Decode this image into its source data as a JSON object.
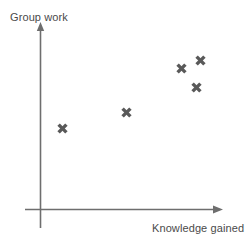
{
  "chart_data": {
    "type": "scatter",
    "title": "",
    "xlabel": "Knowledge gained",
    "ylabel": "Group work",
    "grid": false,
    "legend": null,
    "axis_arrows": true,
    "xticks": [],
    "yticks": [],
    "xlim": [
      0,
      10
    ],
    "ylim": [
      0,
      10
    ],
    "marker_style": "bold-x",
    "marker_color": "#595959",
    "axis_color": "#6e6e6e",
    "label_color": "#4a4a4a",
    "background_color": "#ffffff",
    "points": [
      {
        "x": 1.3,
        "y": 4.4
      },
      {
        "x": 4.7,
        "y": 5.3
      },
      {
        "x": 7.7,
        "y": 7.7
      },
      {
        "x": 8.8,
        "y": 8.2
      },
      {
        "x": 8.5,
        "y": 6.7
      }
    ],
    "point_pixels": [
      {
        "cx": 62,
        "cy": 128
      },
      {
        "cx": 126,
        "cy": 112
      },
      {
        "cx": 181,
        "cy": 68
      },
      {
        "cx": 200,
        "cy": 60
      },
      {
        "cx": 196,
        "cy": 87
      }
    ]
  }
}
